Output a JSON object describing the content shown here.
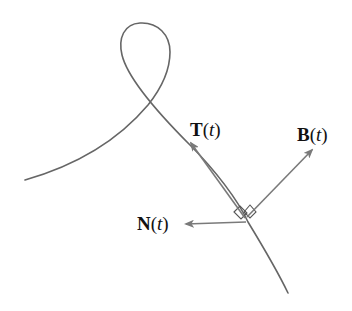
{
  "diagram": {
    "type": "frenet-frame",
    "colors": {
      "curve": "#666666",
      "arrow": "#7a7a7a",
      "label": "#111111",
      "background": "#ffffff"
    },
    "vectors": [
      {
        "id": "T",
        "symbol": "T",
        "param": "t",
        "open": "(",
        "close": ")",
        "name": "tangent"
      },
      {
        "id": "B",
        "symbol": "B",
        "param": "t",
        "open": "(",
        "close": ")",
        "name": "binormal"
      },
      {
        "id": "N",
        "symbol": "N",
        "param": "t",
        "open": "(",
        "close": ")",
        "name": "normal"
      }
    ]
  }
}
